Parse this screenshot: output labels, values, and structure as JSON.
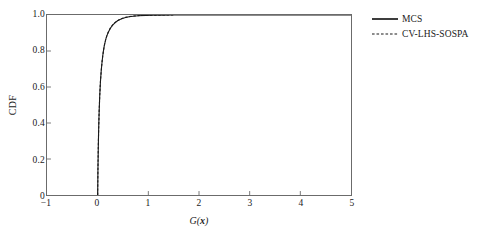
{
  "chart_data": {
    "type": "line",
    "title": "",
    "xlabel": "G(x)",
    "xlabel_prefix": "G(",
    "xlabel_var": "x",
    "xlabel_suffix": ")",
    "ylabel": "CDF",
    "xlim": [
      -1,
      5
    ],
    "ylim": [
      0,
      1
    ],
    "xticks": [
      -1,
      0,
      1,
      2,
      3,
      4,
      5
    ],
    "xtick_labels": [
      "−1",
      "0",
      "1",
      "2",
      "3",
      "4",
      "5"
    ],
    "yticks": [
      0,
      0.2,
      0.4,
      0.6,
      0.8,
      1.0
    ],
    "ytick_labels": [
      "0",
      "0.2",
      "0.4",
      "0.6",
      "0.8",
      "1.0"
    ],
    "grid": false,
    "legend_position": "outside-top-right",
    "series": [
      {
        "name": "MCS",
        "style": "solid",
        "color": "#1a1a1a",
        "x": [
          0.0,
          0.005,
          0.012,
          0.02,
          0.03,
          0.042,
          0.055,
          0.07,
          0.085,
          0.1,
          0.115,
          0.13,
          0.148,
          0.165,
          0.185,
          0.205,
          0.225,
          0.25,
          0.275,
          0.3,
          0.33,
          0.36,
          0.4,
          0.44,
          0.49,
          0.55,
          0.62,
          0.7,
          0.8,
          0.95,
          1.1,
          1.3,
          1.5,
          1.8,
          2.2,
          2.8,
          3.5,
          4.2,
          5.0
        ],
        "y": [
          0.0,
          0.13,
          0.26,
          0.37,
          0.47,
          0.56,
          0.63,
          0.69,
          0.735,
          0.772,
          0.802,
          0.828,
          0.851,
          0.87,
          0.887,
          0.901,
          0.913,
          0.926,
          0.936,
          0.945,
          0.954,
          0.961,
          0.969,
          0.975,
          0.981,
          0.986,
          0.99,
          0.993,
          0.996,
          0.998,
          0.999,
          0.9995,
          1.0,
          1.0,
          1.0,
          1.0,
          1.0,
          1.0,
          1.0
        ]
      },
      {
        "name": "CV-LHS-SOSPA",
        "style": "dashed",
        "color": "#1a1a1a",
        "x": [
          0.0,
          0.005,
          0.012,
          0.02,
          0.03,
          0.042,
          0.055,
          0.07,
          0.085,
          0.1,
          0.115,
          0.13,
          0.148,
          0.165,
          0.185,
          0.205,
          0.225,
          0.25,
          0.275,
          0.3,
          0.33,
          0.36,
          0.4,
          0.44,
          0.49,
          0.55,
          0.62,
          0.7,
          0.8,
          0.95,
          1.1,
          1.25,
          1.4,
          1.5
        ],
        "y": [
          0.0,
          0.132,
          0.262,
          0.372,
          0.472,
          0.558,
          0.632,
          0.688,
          0.736,
          0.773,
          0.803,
          0.829,
          0.852,
          0.871,
          0.888,
          0.902,
          0.914,
          0.927,
          0.937,
          0.946,
          0.955,
          0.962,
          0.97,
          0.976,
          0.982,
          0.987,
          0.991,
          0.994,
          0.9965,
          0.9985,
          0.999,
          0.9996,
          1.0,
          1.0
        ]
      }
    ]
  },
  "legend": {
    "entries": [
      {
        "label": "MCS",
        "style": "solid"
      },
      {
        "label": "CV-LHS-SOSPA",
        "style": "dashed"
      }
    ]
  }
}
